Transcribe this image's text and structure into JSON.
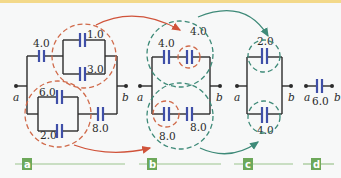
{
  "colors": {
    "wire": "#2b2b2b",
    "plate": "#3f4fa8",
    "red_circle": "#d06a4a",
    "green_circle": "#3e8a78",
    "step_box": "#6da85a",
    "top_bar": "#f3d98a"
  },
  "diagram": {
    "panel_a": {
      "step_label": "a",
      "terminal_a": "a",
      "terminal_b": "b",
      "capacitors": {
        "c_series_top": "4.0",
        "c_par_top_upper": "1.0",
        "c_par_top_lower": "3.0",
        "c_par_bot_upper": "6.0",
        "c_par_bot_lower": "2.0",
        "c_series_bot": "8.0"
      }
    },
    "panel_b": {
      "step_label": "b",
      "terminal_a": "a",
      "terminal_b": "b",
      "capacitors": {
        "top_left": "4.0",
        "top_right": "4.0",
        "bot_left": "8.0",
        "bot_right": "8.0"
      }
    },
    "panel_c": {
      "step_label": "c",
      "terminal_a": "a",
      "terminal_b": "b",
      "capacitors": {
        "top": "2.0",
        "bottom": "4.0"
      }
    },
    "panel_d": {
      "step_label": "d",
      "terminal_a": "a",
      "terminal_b": "b",
      "capacitors": {
        "equivalent": "6.0"
      }
    }
  }
}
